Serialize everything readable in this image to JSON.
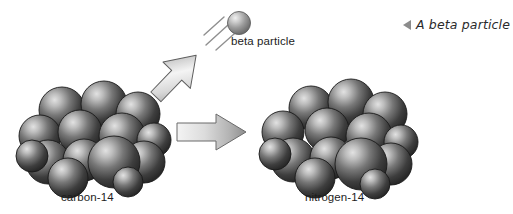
{
  "figure": {
    "type": "diagram",
    "topic": "beta decay of carbon-14 into nitrogen-14",
    "background_color": "#ffffff"
  },
  "labels": {
    "left_nucleus": "carbon-14",
    "right_nucleus": "nitrogen-14",
    "emitted_particle": "beta particle"
  },
  "caption": {
    "text": "A beta particle",
    "marker_icon": "left-triangle-marker",
    "marker_color": "#8c8c8c"
  },
  "arrows": {
    "decay_arrow_name": "diagonal-emission-arrow",
    "transform_arrow_name": "horizontal-transformation-arrow"
  },
  "colors": {
    "sphere_dark": "#2b2b2b",
    "sphere_mid": "#555555",
    "sphere_highlight": "#d2d2d2",
    "arrow_light": "#f2f2f2",
    "arrow_mid": "#b7b7b7",
    "arrow_dark": "#6e6e6e",
    "text": "#1d1d1d"
  },
  "nuclei": {
    "carbon": {
      "name": "carbon-14-nucleus",
      "particle_count": 14
    },
    "nitrogen": {
      "name": "nitrogen-14-nucleus",
      "particle_count": 14
    }
  }
}
